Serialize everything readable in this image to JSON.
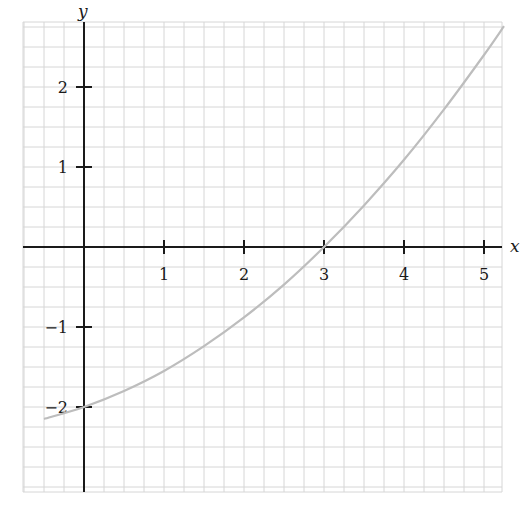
{
  "chart_data": {
    "type": "line",
    "title": "",
    "xlabel": "x",
    "ylabel": "y",
    "xlim": [
      -0.75,
      5.25
    ],
    "ylim": [
      -3.05,
      2.8
    ],
    "grid": true,
    "grid_step": 0.25,
    "x_ticks": [
      1,
      2,
      3,
      4,
      5
    ],
    "x_tick_labels": [
      "1",
      "2",
      "3",
      "4",
      "5"
    ],
    "y_ticks": [
      2,
      1,
      -1,
      -2
    ],
    "y_tick_labels": [
      "2",
      "1",
      "−1",
      "−2"
    ],
    "series": [
      {
        "name": "curve",
        "color": "#bdbdbd",
        "x": [
          -0.5,
          0,
          0.5,
          1,
          1.5,
          2,
          2.5,
          3,
          3.5,
          4,
          4.5,
          5,
          5.25
        ],
        "y": [
          -2.15,
          -2.0,
          -1.8,
          -1.55,
          -1.24,
          -0.88,
          -0.47,
          0.0,
          0.52,
          1.09,
          1.72,
          2.4,
          2.76
        ]
      }
    ],
    "points_of_interest": [
      {
        "x": 0,
        "y": -2,
        "note": "y-intercept"
      },
      {
        "x": 3,
        "y": 0,
        "note": "x-intercept"
      }
    ]
  },
  "labels": {
    "x_axis": "x",
    "y_axis": "y",
    "x_ticks": [
      "1",
      "2",
      "3",
      "4",
      "5"
    ],
    "y_ticks": [
      "2",
      "1",
      "−1",
      "−2"
    ]
  }
}
